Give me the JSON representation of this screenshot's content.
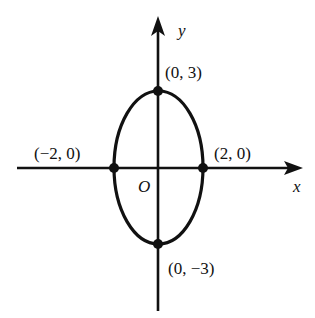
{
  "diagram": {
    "type": "ellipse-on-axes",
    "axes": {
      "x_label": "x",
      "y_label": "y",
      "origin_label": "O"
    },
    "ellipse": {
      "center": [
        0,
        0
      ],
      "semi_axis_x": 2,
      "semi_axis_y": 3
    },
    "points": [
      {
        "id": "top",
        "coords": [
          0,
          3
        ],
        "label": "(0, 3)"
      },
      {
        "id": "left",
        "coords": [
          -2,
          0
        ],
        "label": "(−2, 0)"
      },
      {
        "id": "right",
        "coords": [
          2,
          0
        ],
        "label": "(2, 0)"
      },
      {
        "id": "bottom",
        "coords": [
          0,
          -3
        ],
        "label": "(0, −3)"
      }
    ],
    "colors": {
      "stroke": "#111111",
      "background": "#ffffff"
    }
  }
}
